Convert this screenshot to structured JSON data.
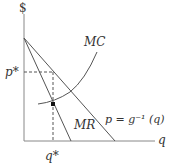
{
  "diagram": {
    "type": "monopoly-pricing",
    "y_axis_label": "$",
    "x_axis_label": "q",
    "price_label": "p*",
    "quantity_label": "q*",
    "curves": {
      "mc_label": "MC",
      "mr_label": "MR",
      "demand_label": "p = g⁻¹ (q)"
    },
    "colors": {
      "axis": "#777777",
      "line": "#555555",
      "dashed": "#555555",
      "point": "#111111"
    }
  }
}
